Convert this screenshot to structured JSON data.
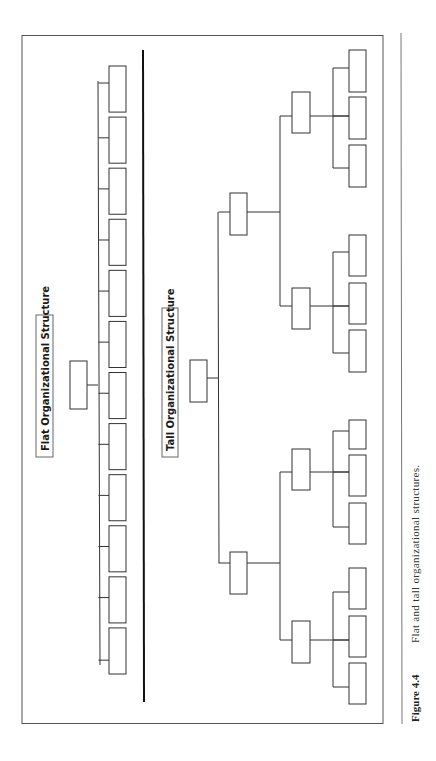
{
  "figure": {
    "number_label": "Figure 4.4",
    "caption": "Flat and tall organizational structures."
  },
  "flat": {
    "title": "Flat Organizational Structure",
    "head_count": 1,
    "subordinate_count": 12
  },
  "tall": {
    "title": "Tall Organizational Structure",
    "levels": [
      {
        "level": 1,
        "count": 1
      },
      {
        "level": 2,
        "count": 2
      },
      {
        "level": 3,
        "count": 4
      },
      {
        "level": 4,
        "count": 12
      }
    ]
  },
  "colors": {
    "line": "#333333",
    "frame": "#555555",
    "background": "#ffffff"
  }
}
